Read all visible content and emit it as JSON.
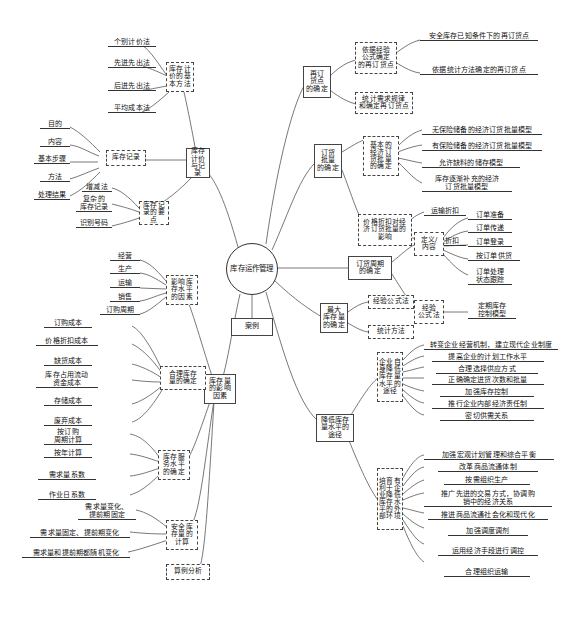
{
  "central": {
    "label": "库存运作管理"
  },
  "case_node": {
    "label": "案例"
  },
  "branches": {
    "valuation_record": {
      "label": "库存\n计价\n与记录",
      "basic_methods": {
        "label": "库存计\n价的基\n本方法",
        "items": [
          "个别计价法",
          "先进先出法",
          "后进先出法",
          "平均成本法"
        ]
      },
      "inventory_record": {
        "label": "库存记录",
        "items": [
          "目的",
          "内容",
          "基本步骤",
          "方法",
          "处理结果"
        ]
      },
      "record_points": {
        "label": "库存记\n录的要点",
        "items": [
          "增减法",
          "复杂的\n库存记录",
          "识别号码"
        ]
      }
    },
    "reorder_point": {
      "label": "再订\n货点\n的确定",
      "children": [
        {
          "label": "依据经验\n公式确定\n的再订货点",
          "items": [
            "安全库存已知条件下的再订货点",
            "依据统计方法确定的再订货点"
          ]
        },
        {
          "label": "统计需求规律\n和确定再订货点",
          "items": []
        }
      ]
    },
    "order_quantity": {
      "label": "订货\n批量\n的确定",
      "children": [
        {
          "label": "基本的\n经济订\n货批量\n的确定",
          "items": [
            "无保险储备的经济订货批量模型",
            "有保险储备的经济订货批量模型",
            "允许缺料的储存模型",
            "库存逐渐补充的经济\n订货批量模型"
          ]
        },
        {
          "label": "价格折扣对经\n济订货批量的\n影响",
          "items": [
            "运输折扣",
            "数量折扣"
          ]
        }
      ]
    },
    "order_cycle": {
      "label": "订货周期\n的确定",
      "children": [
        {
          "label": "定义/\n内容",
          "items": [
            "订单准备",
            "订单传递",
            "订单登录",
            "按订单供货",
            "订单处理\n状态跟踪"
          ]
        },
        {
          "label": "经验\n公式法",
          "items": [
            "定期库存\n控制模型"
          ]
        }
      ]
    },
    "max_inventory": {
      "label": "最大\n库存量\n的确定",
      "items": [
        "经验公式法",
        "统计方法"
      ]
    },
    "influence_factors": {
      "label": "库存量\n的影响\n因素",
      "groups": [
        {
          "label": "影响库\n存水平\n的因素",
          "items": [
            "经营",
            "生产",
            "运输",
            "销售",
            "订购周期"
          ]
        },
        {
          "label": "合理库存\n量的确定",
          "items": [
            "订购成本",
            "价格折扣成本",
            "缺货成本",
            "库存占用流动\n资金成本",
            "存储成本",
            "废弃成本"
          ]
        },
        {
          "label": "库存服\n务水平\n的确定",
          "items": [
            "按订购\n周期计算",
            "按年计算",
            "需求量系数",
            "作业日系数"
          ]
        },
        {
          "label": "安全库\n存量的\n计算",
          "items": [
            "需求量变化、\n提前期固定",
            "需求量固定、提前期变化",
            "需求量和提前期都随机变化"
          ]
        },
        {
          "label": "算例分析",
          "items": []
        }
      ]
    },
    "reduce_level": {
      "label": "降低库存\n量水平的\n途径",
      "groups": [
        {
          "label": "企业自\n身降低\n库存量\n水平的\n途径",
          "items": [
            "转变企业经营机制，建立现代企业制度",
            "提高企业的计划工作水平",
            "合理选择供应方式",
            "正确确定进货次数和批量",
            "加强库存控制",
            "推行企业内部经济责任制",
            "密切供需关系"
          ]
        },
        {
          "label": "培育有\n利于企\n业降低\n库存水\n平的外\n部环境",
          "items": [
            "加强宏观计划管理和综合平衡",
            "改革商品流通体制",
            "按需组织生产",
            "推广先进的交易方式，协调购\n销中的经济关系",
            "推进商品流通社会化和现代化",
            "加强调度调剂",
            "运用经济手段进行调控",
            "合理组织运输"
          ]
        }
      ]
    }
  }
}
